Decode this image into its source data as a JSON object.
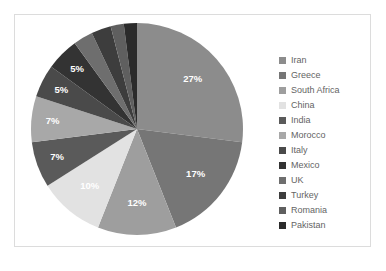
{
  "chart_data": {
    "type": "pie",
    "title": "",
    "legend_position": "right",
    "labels": [
      "Iran",
      "Greece",
      "South Africa",
      "China",
      "India",
      "Morocco",
      "Italy",
      "Mexico",
      "UK",
      "Turkey",
      "Romania",
      "Pakistan"
    ],
    "values": [
      27,
      17,
      12,
      10,
      7,
      7,
      5,
      5,
      3,
      3,
      2,
      2
    ],
    "value_labels": [
      "27%",
      "17%",
      "12%",
      "10%",
      "7%",
      "7%",
      "5%",
      "5%",
      "3%",
      "3%",
      "2%",
      "2%"
    ],
    "colors": [
      "#8c8c8c",
      "#767676",
      "#9e9e9e",
      "#e2e2e2",
      "#5a5a5a",
      "#a8a8a8",
      "#4a4a4a",
      "#333333",
      "#6e6e6e",
      "#3d3d3d",
      "#5f5f5f",
      "#2b2b2b"
    ],
    "start_angle_deg": 0,
    "direction": "clockwise",
    "units": "percent"
  },
  "legend": {
    "items": [
      {
        "label": "Iran",
        "color": "#8c8c8c"
      },
      {
        "label": "Greece",
        "color": "#767676"
      },
      {
        "label": "South Africa",
        "color": "#9e9e9e"
      },
      {
        "label": "China",
        "color": "#e2e2e2"
      },
      {
        "label": "India",
        "color": "#5a5a5a"
      },
      {
        "label": "Morocco",
        "color": "#a8a8a8"
      },
      {
        "label": "Italy",
        "color": "#4a4a4a"
      },
      {
        "label": "Mexico",
        "color": "#333333"
      },
      {
        "label": "UK",
        "color": "#6e6e6e"
      },
      {
        "label": "Turkey",
        "color": "#3d3d3d"
      },
      {
        "label": "Romania",
        "color": "#5f5f5f"
      },
      {
        "label": "Pakistan",
        "color": "#2b2b2b"
      }
    ]
  },
  "style": {
    "frame_border_color": "#dcdcdc",
    "label_text_color": "#ffffff",
    "legend_text_color": "#646464",
    "background": "#ffffff"
  }
}
